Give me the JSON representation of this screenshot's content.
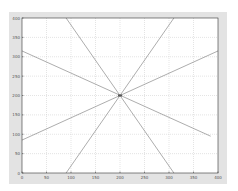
{
  "chart_data": {
    "type": "line",
    "title": "",
    "xlabel": "",
    "ylabel": "",
    "xlim": [
      0,
      400
    ],
    "ylim": [
      0,
      400
    ],
    "grid": true,
    "xticks": [
      0,
      50,
      100,
      150,
      200,
      250,
      300,
      350,
      400
    ],
    "yticks": [
      0,
      50,
      100,
      150,
      200,
      250,
      300,
      350,
      400
    ],
    "center_point": {
      "x": 200,
      "y": 200
    },
    "series": [
      {
        "name": "line-1",
        "x": [
          90,
          310
        ],
        "y": [
          400,
          0
        ]
      },
      {
        "name": "line-2",
        "x": [
          90,
          310
        ],
        "y": [
          0,
          400
        ]
      },
      {
        "name": "line-3",
        "x": [
          0,
          400
        ],
        "y": [
          85,
          315
        ]
      },
      {
        "name": "line-4",
        "x": [
          0,
          385
        ],
        "y": [
          315,
          95
        ]
      }
    ],
    "colors": {
      "line": "#8a8a8a",
      "grid": "#c8c8c8",
      "axes": "#333333",
      "figure_bg": "#e3e3e3",
      "plot_bg": "#ffffff",
      "center_marker": "#555555"
    }
  }
}
